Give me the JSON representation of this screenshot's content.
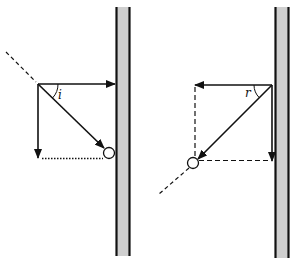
{
  "diagram": {
    "title": "",
    "colors": {
      "ink": "#111111",
      "wall_fill": "#cfcfcf",
      "background": "#ffffff"
    },
    "panels": [
      {
        "id": "incidence",
        "angle_label": "i",
        "description": "Incoming ball velocity decomposed into horizontal (toward wall) and vertical components; ball at wall"
      },
      {
        "id": "reflection",
        "angle_label": "r",
        "description": "Reflected ball velocity decomposed into horizontal (away from wall) and vertical components"
      }
    ]
  }
}
